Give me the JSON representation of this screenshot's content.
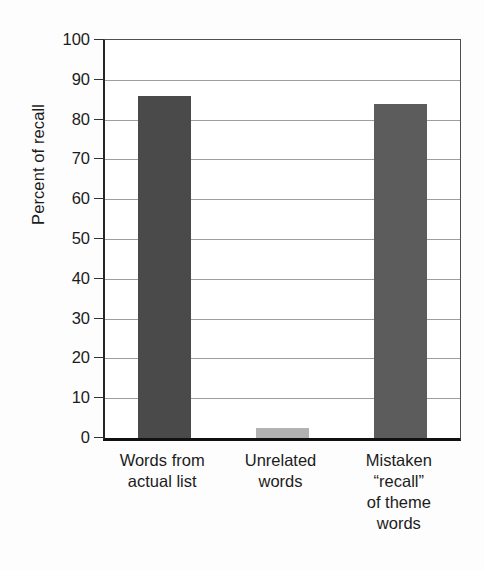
{
  "chart_data": {
    "type": "bar",
    "title": "",
    "subtitle": "",
    "xlabel": "",
    "ylabel": "Percent of recall",
    "ylim": [
      0,
      100
    ],
    "ytick_step": 10,
    "yticks": [
      0,
      10,
      20,
      30,
      40,
      50,
      60,
      70,
      80,
      90,
      100
    ],
    "ytick_labels": [
      "0",
      "10",
      "20",
      "30",
      "40",
      "50",
      "60",
      "70",
      "80",
      "90",
      "100"
    ],
    "grid": "horizontal",
    "legend": "none",
    "categories": [
      "Words from actual list",
      "Unrelated words",
      "Mistaken “recall” of theme words"
    ],
    "category_label_lines": [
      [
        "Words from",
        "actual list"
      ],
      [
        "Unrelated",
        "words"
      ],
      [
        "Mistaken",
        "“recall”",
        "of theme",
        "words"
      ]
    ],
    "values": [
      86,
      2.5,
      84
    ],
    "bar_colors": [
      "#4a4a4a",
      "#b2b2b2",
      "#5c5c5c"
    ],
    "annotations": []
  },
  "colors": {
    "background": "#fdfdfd",
    "plot_background": "#ffffff",
    "axis": "#1a1a1a",
    "gridline": "#8d8d8d",
    "text": "#1c1c1c"
  }
}
